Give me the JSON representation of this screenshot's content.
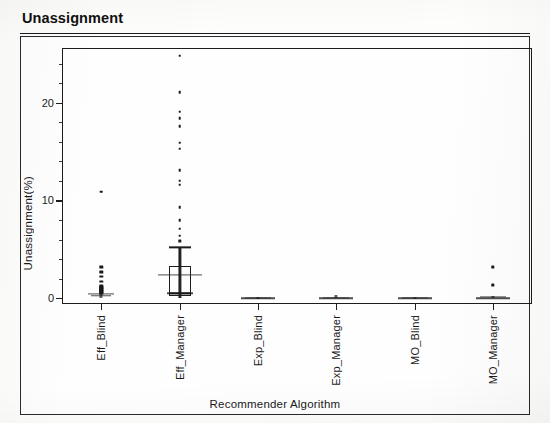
{
  "figure": {
    "title": "Unassignment"
  },
  "chart_data": {
    "type": "box",
    "title": "Unassignment",
    "xlabel": "Recommender Algorithm",
    "ylabel": "Unassignment(%)",
    "categories": [
      "Eff_Blind",
      "Eff_Manager",
      "Exp_Blind",
      "Exp_Manager",
      "MO_Blind",
      "MO_Manager"
    ],
    "ylim": [
      -0.6,
      25.6
    ],
    "ytick_values": [
      0,
      10,
      20
    ],
    "ytick_labels": [
      "0",
      "10",
      "20"
    ],
    "yminor_step": 2,
    "grid": false,
    "legend": null,
    "series": [
      {
        "name": "Eff_Blind",
        "median": 0.25,
        "q1": 0.05,
        "q3": 0.55,
        "whisker_low": 0.0,
        "whisker_high": 1.1,
        "mean_marker": 0.45,
        "outliers": [
          1.7,
          2.2,
          2.7,
          3.2,
          10.9
        ]
      },
      {
        "name": "Eff_Manager",
        "median": 0.5,
        "q1": 0.2,
        "q3": 3.3,
        "whisker_low": 0.0,
        "whisker_high": 5.2,
        "mean_marker": 2.4,
        "outliers": [
          5.8,
          6.4,
          7.1,
          8.0,
          9.3,
          11.6,
          12.0,
          13.1,
          15.3,
          15.9,
          17.6,
          18.4,
          19.1,
          21.1,
          24.8
        ]
      },
      {
        "name": "Exp_Blind",
        "median": 0.0,
        "q1": 0.0,
        "q3": 0.05,
        "whisker_low": 0.0,
        "whisker_high": 0.1,
        "mean_marker": 0.05,
        "outliers": []
      },
      {
        "name": "Exp_Manager",
        "median": 0.0,
        "q1": 0.0,
        "q3": 0.05,
        "whisker_low": 0.0,
        "whisker_high": 0.1,
        "mean_marker": 0.05,
        "outliers": [
          0.35
        ]
      },
      {
        "name": "MO_Blind",
        "median": 0.0,
        "q1": 0.0,
        "q3": 0.05,
        "whisker_low": 0.0,
        "whisker_high": 0.1,
        "mean_marker": 0.05,
        "outliers": []
      },
      {
        "name": "MO_Manager",
        "median": 0.0,
        "q1": 0.0,
        "q3": 0.1,
        "whisker_low": 0.0,
        "whisker_high": 0.2,
        "mean_marker": 0.1,
        "outliers": [
          1.35,
          3.2
        ]
      }
    ],
    "scatter_overlay": {
      "Eff_Blind": [
        0.0,
        0.0,
        0.0,
        0.0,
        0.0,
        0.05,
        0.05,
        0.1,
        0.1,
        0.15,
        0.2,
        0.2,
        0.25,
        0.3,
        0.35,
        0.4,
        0.45,
        0.5,
        0.6,
        0.7,
        0.8,
        0.9,
        1.0,
        1.1,
        1.25,
        1.7,
        2.2,
        2.7,
        3.2,
        10.9
      ],
      "Eff_Manager": [
        0.0,
        0.05,
        0.1,
        0.15,
        0.2,
        0.25,
        0.3,
        0.4,
        0.5,
        0.6,
        0.75,
        0.9,
        1.1,
        1.3,
        1.5,
        1.8,
        2.1,
        2.4,
        2.7,
        3.0,
        3.3,
        3.6,
        4.0,
        4.4,
        4.8,
        5.2,
        5.8,
        6.4,
        7.1,
        8.0,
        9.3,
        11.6,
        12.0,
        13.1,
        15.3,
        15.9,
        17.6,
        18.4,
        19.1,
        21.1,
        24.8
      ],
      "Exp_Blind": [
        0.0,
        0.0,
        0.0,
        0.05,
        0.05,
        0.1
      ],
      "Exp_Manager": [
        0.0,
        0.0,
        0.0,
        0.05,
        0.1,
        0.35
      ],
      "MO_Blind": [
        0.0,
        0.0,
        0.0,
        0.05,
        0.05,
        0.1
      ],
      "MO_Manager": [
        0.0,
        0.0,
        0.05,
        0.1,
        0.2,
        1.35,
        3.2
      ]
    }
  }
}
